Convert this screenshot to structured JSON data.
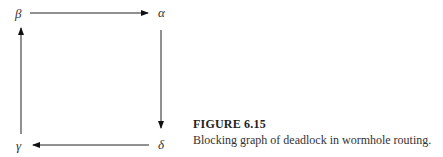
{
  "figure": {
    "nodes": {
      "beta": "β",
      "alpha": "α",
      "gamma": "γ",
      "delta": "δ"
    },
    "edges": [
      {
        "from": "β",
        "to": "α"
      },
      {
        "from": "α",
        "to": "δ"
      },
      {
        "from": "δ",
        "to": "γ"
      },
      {
        "from": "γ",
        "to": "β"
      }
    ]
  },
  "caption": {
    "title": "FIGURE 6.15",
    "text": "Blocking graph of deadlock in wormhole routing."
  }
}
